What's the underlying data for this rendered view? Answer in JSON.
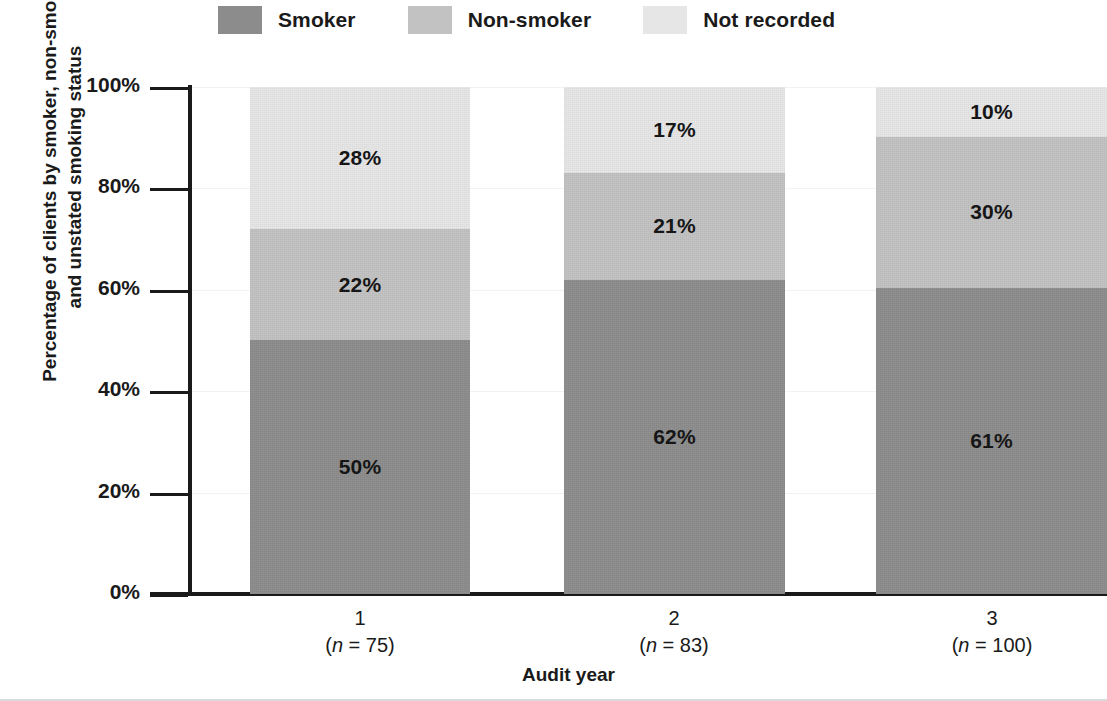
{
  "chart_data": {
    "type": "bar",
    "subtype": "stacked-percentage",
    "title": "",
    "xlabel": "Audit year",
    "ylabel": "Percentage of clients by smoker, non-smoker and unstated smoking status",
    "ylabel_line1": "Percentage of clients by smoker, non-smoker",
    "ylabel_line2": "and unstated smoking status",
    "ylim": [
      0,
      100
    ],
    "yticks": [
      "0%",
      "20%",
      "40%",
      "60%",
      "80%",
      "100%"
    ],
    "ytick_values": [
      0,
      20,
      40,
      60,
      80,
      100
    ],
    "grid": true,
    "legend_position": "top",
    "categories": [
      "1",
      "2",
      "3"
    ],
    "category_sublabels": [
      "(n = 75)",
      "(n = 83)",
      "(n = 100)"
    ],
    "category_n": [
      75,
      83,
      100
    ],
    "series": [
      {
        "name": "Smoker",
        "color": "#8c8c8c",
        "values": [
          50,
          62,
          61
        ],
        "labels": [
          "50%",
          "62%",
          "61%"
        ]
      },
      {
        "name": "Non-smoker",
        "color": "#c2c2c2",
        "values": [
          22,
          21,
          30
        ],
        "labels": [
          "22%",
          "21%",
          "30%"
        ]
      },
      {
        "name": "Not recorded",
        "color": "#e6e6e6",
        "values": [
          28,
          17,
          10
        ],
        "labels": [
          "28%",
          "17%",
          "10%"
        ]
      }
    ]
  },
  "legend": {
    "items": [
      {
        "label": "Smoker",
        "color": "#8c8c8c"
      },
      {
        "label": "Non-smoker",
        "color": "#c2c2c2"
      },
      {
        "label": "Not recorded",
        "color": "#e6e6e6"
      }
    ]
  },
  "axes": {
    "y": {
      "label_line1": "Percentage of clients by smoker, non-smoker",
      "label_line2": "and unstated smoking status",
      "ticks": [
        "100%",
        "80%",
        "60%",
        "40%",
        "20%",
        "0%"
      ]
    },
    "x": {
      "label": "Audit year",
      "categories": [
        {
          "name": "1",
          "n_prefix": "(",
          "n_symbol": "n",
          "n_value": " = 75)"
        },
        {
          "name": "2",
          "n_prefix": "(",
          "n_symbol": "n",
          "n_value": " = 83)"
        },
        {
          "name": "3",
          "n_prefix": "(",
          "n_symbol": "n",
          "n_value": " = 100)"
        }
      ]
    }
  },
  "bars": [
    {
      "category": "1",
      "segments": [
        {
          "series": "Not recorded",
          "label": "28%",
          "value": 28,
          "color": "#e6e6e6"
        },
        {
          "series": "Non-smoker",
          "label": "22%",
          "value": 22,
          "color": "#c2c2c2"
        },
        {
          "series": "Smoker",
          "label": "50%",
          "value": 50,
          "color": "#8c8c8c"
        }
      ]
    },
    {
      "category": "2",
      "segments": [
        {
          "series": "Not recorded",
          "label": "17%",
          "value": 17,
          "color": "#e6e6e6"
        },
        {
          "series": "Non-smoker",
          "label": "21%",
          "value": 21,
          "color": "#c2c2c2"
        },
        {
          "series": "Smoker",
          "label": "62%",
          "value": 62,
          "color": "#8c8c8c"
        }
      ]
    },
    {
      "category": "3",
      "segments": [
        {
          "series": "Not recorded",
          "label": "10%",
          "value": 10,
          "color": "#e6e6e6"
        },
        {
          "series": "Non-smoker",
          "label": "30%",
          "value": 30,
          "color": "#c2c2c2"
        },
        {
          "series": "Smoker",
          "label": "61%",
          "value": 61,
          "color": "#8c8c8c"
        }
      ]
    }
  ],
  "geometry": {
    "bar_lefts": [
      250,
      564,
      876
    ],
    "bar_widths": [
      220,
      221,
      231
    ],
    "cat_centers": [
      360,
      674,
      992
    ]
  }
}
